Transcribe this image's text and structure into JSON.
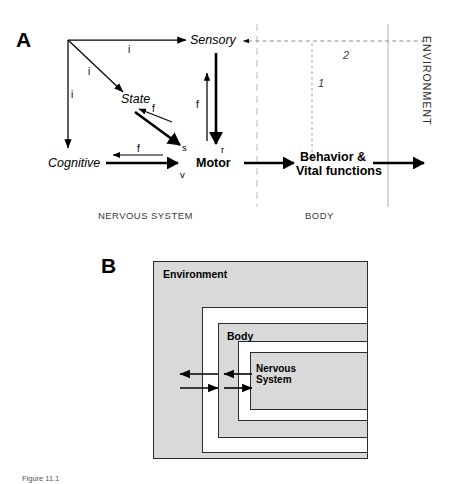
{
  "figure": {
    "panels": [
      {
        "id": "A",
        "letter": "A",
        "nodes": [
          {
            "name": "sensory",
            "label": "Sensory",
            "style": "italic"
          },
          {
            "name": "state",
            "label": "State",
            "style": "italic"
          },
          {
            "name": "cognitive",
            "label": "Cognitive",
            "style": "italic"
          },
          {
            "name": "motor",
            "label": "Motor",
            "style": "bold"
          },
          {
            "name": "behavior",
            "label": "Behavior &\nVital functions",
            "style": "bold"
          }
        ],
        "behavior_line1": "Behavior &",
        "behavior_line2": "Vital functions",
        "edge_labels": [
          {
            "name": "i-top",
            "label": "i"
          },
          {
            "name": "i-diagonal",
            "label": "i"
          },
          {
            "name": "i-vertical",
            "label": "i"
          },
          {
            "name": "f-sensorimotor",
            "label": "f"
          },
          {
            "name": "f-state",
            "label": "f"
          },
          {
            "name": "f-cognitive",
            "label": "f"
          }
        ],
        "terminal_labels": [
          {
            "name": "s-label",
            "label": "s"
          },
          {
            "name": "r-label",
            "label": "r"
          },
          {
            "name": "v-label",
            "label": "v"
          }
        ],
        "loop_numbers": [
          {
            "name": "loop-1",
            "label": "1"
          },
          {
            "name": "loop-2",
            "label": "2"
          }
        ],
        "regions": [
          {
            "name": "nervous-system",
            "label": "NERVOUS SYSTEM"
          },
          {
            "name": "body",
            "label": "BODY"
          },
          {
            "name": "environment",
            "label": "ENVIRONMENT"
          }
        ]
      },
      {
        "id": "B",
        "letter": "B",
        "layers": [
          {
            "name": "environment",
            "label": "Environment",
            "fill": "#d9d9d9"
          },
          {
            "name": "gap-outer",
            "label": "",
            "fill": "#ffffff"
          },
          {
            "name": "body",
            "label": "Body",
            "fill": "#d9d9d9"
          },
          {
            "name": "gap-inner",
            "label": "",
            "fill": "#ffffff"
          },
          {
            "name": "nervous-system",
            "label": "Nervous System",
            "fill": "#d9d9d9"
          }
        ],
        "nervous_system_line1": "Nervous",
        "nervous_system_line2": "System"
      }
    ],
    "caption": "Figure 11.1",
    "colors": {
      "ink": "#000000",
      "gray_fill": "#d9d9d9",
      "box_stroke": "#2b2b2b",
      "divider": "#bfbfbf",
      "muted_text": "#3a3a3a"
    }
  }
}
